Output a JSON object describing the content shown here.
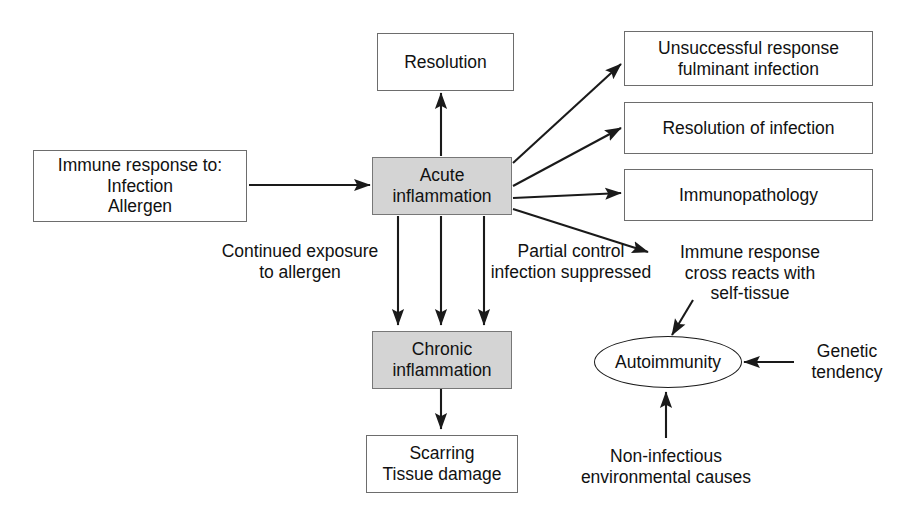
{
  "diagram": {
    "fill_color": "#d4d4d4",
    "line_color": "#1a1a1a",
    "box_border_color": "#6d6d6d",
    "background": "#ffffff",
    "nodes": {
      "immune_response": {
        "label_line_1": "Immune response to:",
        "label_line_2": "Infection",
        "label_line_3": "Allergen",
        "shape": "rectangle"
      },
      "acute_inflammation": {
        "label_line_1": "Acute",
        "label_line_2": "inflammation",
        "shape": "rectangle-filled"
      },
      "resolution": {
        "label_line_1": "Resolution",
        "shape": "rectangle"
      },
      "unsuccessful_response": {
        "label_line_1": "Unsuccessful response",
        "label_line_2": "fulminant infection",
        "shape": "rectangle"
      },
      "resolution_of_infection": {
        "label_line_1": "Resolution of infection",
        "shape": "rectangle"
      },
      "immunopathology": {
        "label_line_1": "Immunopathology",
        "shape": "rectangle"
      },
      "chronic_inflammation": {
        "label_line_1": "Chronic",
        "label_line_2": "inflammation",
        "shape": "rectangle-filled"
      },
      "scarring": {
        "label_line_1": "Scarring",
        "label_line_2": "Tissue damage",
        "shape": "rectangle"
      },
      "autoimmunity": {
        "label_line_1": "Autoimmunity",
        "shape": "ellipse"
      }
    },
    "edge_labels": {
      "continued_exposure": {
        "label_line_1": "Continued exposure",
        "label_line_2": "to allergen"
      },
      "partial_control": {
        "label_line_1": "Partial control",
        "label_line_2": "infection suppressed"
      },
      "cross_reacts": {
        "label_line_1": "Immune response",
        "label_line_2": "cross reacts with",
        "label_line_3": "self-tissue"
      },
      "genetic_tendency": {
        "label_line_1": "Genetic",
        "label_line_2": "tendency"
      },
      "non_infectious": {
        "label_line_1": "Non-infectious",
        "label_line_2": "environmental causes"
      }
    }
  }
}
